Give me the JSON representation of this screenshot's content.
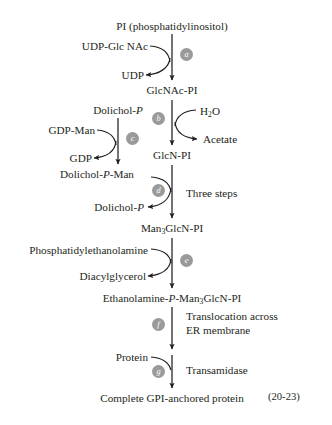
{
  "figure": {
    "reference": "(20-23)",
    "topmost_substrate": "PI (phosphatidylinositol)",
    "final_product": "Complete GPI-anchored protein"
  },
  "main_chain": [
    {
      "id": "pi",
      "text": "PI (phosphatidylinositol)"
    },
    {
      "id": "glcnac_pi",
      "text": "GlcNAc-PI"
    },
    {
      "id": "glcn_pi",
      "text": "GlcN-PI"
    },
    {
      "id": "man3",
      "text_html": "Man<sub>3</sub>GlcN-PI"
    },
    {
      "id": "etn_p",
      "text_html": "Ethanolamine-<i>P</i>-Man<sub>3</sub>GlcN-PI"
    },
    {
      "id": "product",
      "text": "Complete GPI-anchored protein"
    }
  ],
  "side_branch": {
    "substrate_html": "Dolichol-<i>P</i>",
    "product_html": "Dolichol-<i>P</i>-Man"
  },
  "steps": [
    {
      "letter": "a",
      "badge_side": "right",
      "substrate_in": "UDP-Glc NAc",
      "product_out": "UDP",
      "note": ""
    },
    {
      "letter": "b",
      "badge_side": "left",
      "substrate_in_html": "H<sub>2</sub>O",
      "product_out": "Acetate",
      "note": ""
    },
    {
      "letter": "c",
      "badge_side": "right",
      "substrate_in": "GDP-Man",
      "product_out": "GDP",
      "note": ""
    },
    {
      "letter": "d",
      "badge_side": "left",
      "substrate_in_html": "Dolichol-<i>P</i>-Man",
      "product_out_html": "Dolichol-<i>P</i>",
      "note": "Three steps"
    },
    {
      "letter": "e",
      "badge_side": "right",
      "substrate_in": "Phosphatidylethanolamine",
      "product_out": "Diacylglycerol",
      "note": ""
    },
    {
      "letter": "f",
      "badge_side": "left",
      "substrate_in": "",
      "product_out": "",
      "note_line1": "Translocation across",
      "note_line2": "ER membrane"
    },
    {
      "letter": "g",
      "badge_side": "left",
      "substrate_in": "Protein",
      "product_out": "",
      "note": "Transamidase"
    }
  ],
  "colors": {
    "ink": "#231f20",
    "badge_fill": "#9a9a9a",
    "badge_text": "#ffffff",
    "background": "#ffffff"
  }
}
